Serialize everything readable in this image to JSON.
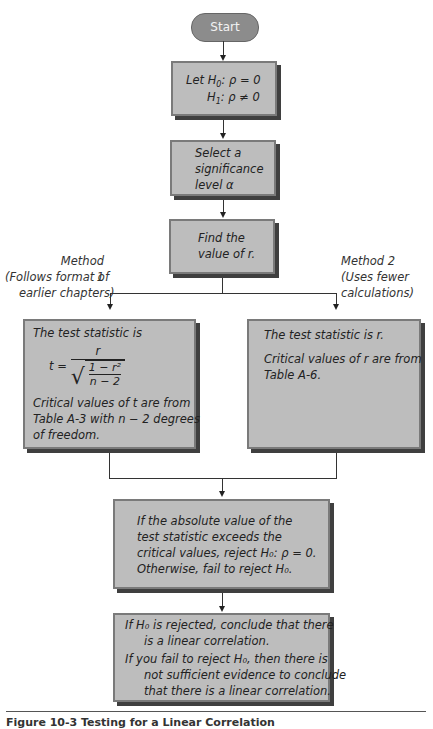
{
  "flowchart": {
    "start": {
      "label": "Start",
      "color": "#8c8c8c"
    },
    "hypotheses": {
      "line1_prefix": "Let ",
      "h0": "H",
      "h0_sub": "0",
      "h0_rest": ": ρ = 0",
      "h1": "H",
      "h1_sub": "1",
      "h1_rest": ": ρ ≠ 0"
    },
    "significance": {
      "line1": "Select a",
      "line2": "significance",
      "line3": "level α"
    },
    "find_r": {
      "line1": "Find the",
      "line2": "value of r."
    },
    "method1": {
      "title": "Method 1",
      "note1": "(Follows format of",
      "note2": "earlier chapters)"
    },
    "method2": {
      "title": "Method 2",
      "note1": "(Uses fewer",
      "note2": "calculations)"
    },
    "box_method1": {
      "line1": "The test statistic is",
      "formula_lhs": "t =",
      "formula_num": "r",
      "formula_inner_num": "1 − r²",
      "formula_inner_den": "n − 2",
      "line2": "Critical values of t are from",
      "line3": "Table A-3 with n − 2 degrees",
      "line4": "of freedom."
    },
    "box_method2": {
      "line1": "The test statistic is r.",
      "line2": "Critical values of r are from",
      "line3": "Table A-6."
    },
    "decision": {
      "line1": "If the absolute value of the",
      "line2": "test statistic exceeds the",
      "line3": "critical values, reject H₀: ρ = 0.",
      "line4": "Otherwise, fail to reject H₀."
    },
    "conclusion": {
      "line1": "If H₀ is rejected, conclude that there",
      "line2": "is a linear correlation.",
      "line3": "If you fail to reject H₀, then there is",
      "line4": "not sufficient evidence to conclude",
      "line5": "that there is a linear correlation."
    },
    "box_fill": "#bdbdbd",
    "box_shadow": "#3f3f3f"
  },
  "caption": "Figure 10-3  Testing for a Linear Correlation"
}
